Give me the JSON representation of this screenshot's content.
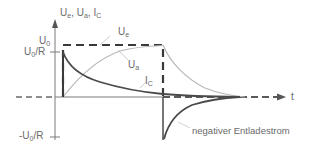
{
  "diagram": {
    "type": "RC circuit pulse response",
    "axes": {
      "y_label": "U_e, U_a, I_C",
      "y_label_parts": {
        "u_e": "U",
        "u_e_sub": "e",
        "u_a": "U",
        "u_a_sub": "a",
        "i_c": "I",
        "i_c_sub": "C",
        "sep": ", "
      },
      "x_label": "t"
    },
    "ticks": {
      "u0": {
        "main": "U",
        "sub": "0"
      },
      "u0_over_r": {
        "main": "U",
        "sub": "0",
        "suffix": "/R"
      },
      "neg_u0_over_r": {
        "prefix": "-U",
        "sub": "0",
        "suffix": "/R"
      }
    },
    "curves": {
      "u_e": {
        "main": "U",
        "sub": "e",
        "description": "input rectangular pulse (dashed)"
      },
      "u_a": {
        "main": "U",
        "sub": "a",
        "description": "capacitor voltage charging/discharging (light gray)"
      },
      "i_c": {
        "main": "I",
        "sub": "C",
        "description": "capacitor current (dark solid)"
      }
    },
    "annotations": {
      "negative_discharge": "negativer Entladestrom"
    },
    "colors": {
      "dashed_pulse": "#3a3a3a",
      "current_curve": "#4a4a4a",
      "voltage_curve": "#b8b8b8",
      "axes": "#7a7a7a",
      "label_text": "#6a6a6a"
    }
  }
}
